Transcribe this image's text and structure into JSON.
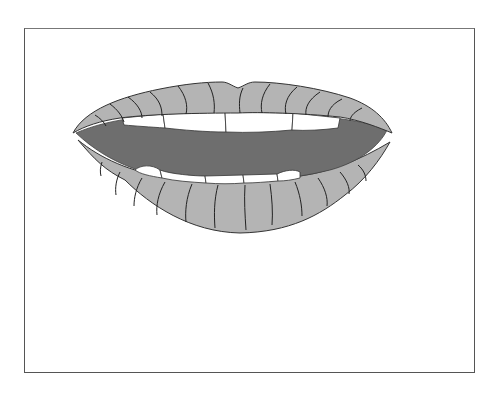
{
  "illustration": {
    "subject": "open mouth with lips and teeth",
    "colors": {
      "frame_border": "#555555",
      "lip_fill": "#b4b4b4",
      "mouth_fill": "#6e6e6e",
      "teeth_fill": "#ffffff",
      "outline": "#333333"
    }
  },
  "caption": ""
}
